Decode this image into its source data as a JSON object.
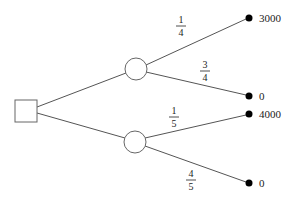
{
  "diagram": {
    "type": "decision-tree",
    "colors": {
      "edge": "#555555",
      "node_outline": "#666666",
      "terminal": "#000000",
      "text": "#222222",
      "background": "#ffffff"
    },
    "decision_node": {
      "shape": "square"
    },
    "chance_nodes": [
      {
        "id": "upper",
        "branches": [
          {
            "probability": {
              "numerator": "1",
              "denominator": "4"
            },
            "payoff": "3000"
          },
          {
            "probability": {
              "numerator": "3",
              "denominator": "4"
            },
            "payoff": "0"
          }
        ]
      },
      {
        "id": "lower",
        "branches": [
          {
            "probability": {
              "numerator": "1",
              "denominator": "5"
            },
            "payoff": "4000"
          },
          {
            "probability": {
              "numerator": "4",
              "denominator": "5"
            },
            "payoff": "0"
          }
        ]
      }
    ]
  }
}
